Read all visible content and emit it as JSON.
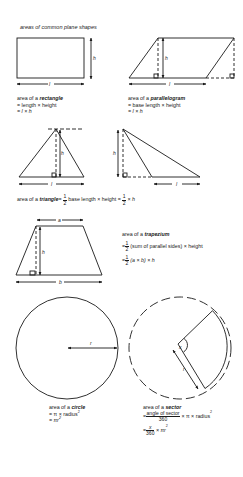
{
  "title": "areas of common plane shapes",
  "rectangle": {
    "intro": "area of a ",
    "name": "rectangle",
    "line1": "= length × height",
    "line2": "= l × h",
    "label_h": "h",
    "label_l": "l"
  },
  "parallelogram": {
    "intro": "area of a ",
    "name": "parallelogram",
    "line1": "= base length × height",
    "line2": "= l × h",
    "label_h": "h",
    "label_l": "l"
  },
  "triangle": {
    "intro": "area of a ",
    "name": "triangle",
    "eq1": "=",
    "frac_num": "1",
    "frac_den": "2",
    "middle": " base length × height = ",
    "tail": " × h",
    "label_h": "h",
    "label_l": "l"
  },
  "trapezium": {
    "intro": "area of a ",
    "name": "trapezium",
    "frac_num": "1",
    "frac_den": "2",
    "line1_tail": " (sum of parallel sides) × height",
    "line2_tail": " (a × b) × h",
    "eq": "=",
    "label_a": "a",
    "label_b": "b",
    "label_h": "h"
  },
  "circle": {
    "intro": "area of a ",
    "name": "circle",
    "line1": "= π × radius",
    "line1_sup": "2",
    "line2": "= πr",
    "line2_sup": "2",
    "label_r": "r"
  },
  "sector": {
    "intro": "area of a ",
    "name": "sector",
    "eq": "=",
    "frac1_num": "angle of sector",
    "frac1_den": "360",
    "line1_tail": " × π × radius",
    "line1_sup": "2",
    "frac2_num": "x",
    "frac2_den": "360",
    "line2_tail": " × πr",
    "line2_sup": "2",
    "label_x": "x",
    "label_r": "r"
  }
}
